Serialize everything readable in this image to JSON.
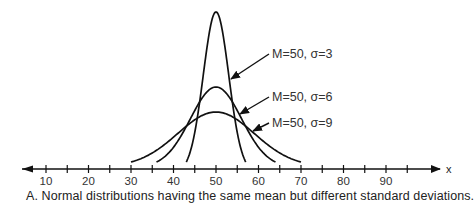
{
  "chart_data": {
    "type": "line",
    "title": "",
    "caption": "A. Normal distributions having the same mean but different standard deviations.",
    "xlabel": "x",
    "ylabel": "",
    "xlim": [
      5,
      97
    ],
    "x_ticks_major": [
      10,
      20,
      30,
      40,
      50,
      60,
      70,
      80,
      90
    ],
    "x_ticks_minor": [
      15,
      25,
      35,
      45,
      55,
      65,
      75,
      85,
      95
    ],
    "grid": false,
    "axis_arrows": "both",
    "series": [
      {
        "name": "M=50, σ=3",
        "mean": 50,
        "sd": 3,
        "x_range": [
          43,
          57
        ]
      },
      {
        "name": "M=50, σ=6",
        "mean": 50,
        "sd": 6,
        "x_range": [
          36,
          64
        ]
      },
      {
        "name": "M=50, σ=9",
        "mean": 50,
        "sd": 9,
        "x_range": [
          30,
          70
        ]
      }
    ],
    "annotations": [
      {
        "text": "M=50, σ=3",
        "points_to": "σ=3 curve"
      },
      {
        "text": "M=50, σ=6",
        "points_to": "σ=6 curve"
      },
      {
        "text": "M=50, σ=9",
        "points_to": "σ=9 curve"
      }
    ]
  }
}
